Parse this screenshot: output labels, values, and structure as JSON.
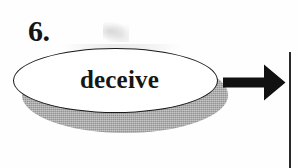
{
  "worksheet": {
    "item_number": "6.",
    "word_bubble": {
      "text": "deceive",
      "shape": "ellipse",
      "outline_color": "#1a1a1a",
      "fill_color": "#ffffff",
      "shadow_color": "#8b8b8b"
    },
    "arrow": {
      "icon": "right-arrow-icon",
      "direction": "right",
      "color": "#111111"
    },
    "answer_box": {
      "border_color": "#2a2a2a",
      "value": ""
    }
  },
  "page": {
    "background_color": "#fefefe"
  }
}
